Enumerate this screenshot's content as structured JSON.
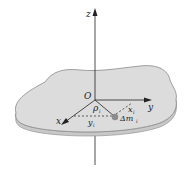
{
  "diagram": {
    "type": "3d-coordinate-plate",
    "labels": {
      "z_axis": "z",
      "y_axis": "y",
      "x_axis": "x",
      "origin": "O",
      "rho": "ρ",
      "rho_sub": "i",
      "x_comp": "x",
      "x_comp_sub": "i",
      "y_comp": "y",
      "y_comp_sub": "i",
      "mass": "Δm",
      "mass_sub": "i"
    },
    "colors": {
      "plate_fill": "#d9d9d9",
      "plate_edge": "#8a8a8a",
      "axis": "#222222",
      "mass_point": "#8c8c8c"
    }
  }
}
